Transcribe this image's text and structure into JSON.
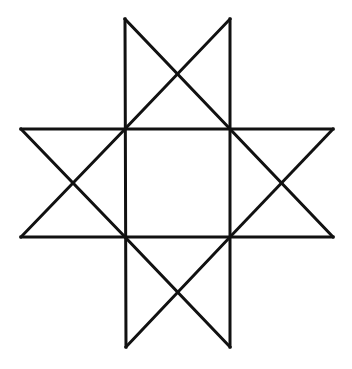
{
  "figure": {
    "background": "#ffffff",
    "stroke_color": "#111111",
    "stroke_width": 3,
    "vertices": {
      "top_left": [
        125,
        19
      ],
      "top_right": [
        230,
        19
      ],
      "left_top": [
        21,
        129
      ],
      "left_bottom": [
        21,
        237
      ],
      "right_top": [
        333,
        129
      ],
      "right_bottom": [
        333,
        237
      ],
      "bottom_left": [
        126,
        347
      ],
      "bottom_right": [
        230,
        347
      ],
      "inner_top_left": [
        125,
        129
      ],
      "inner_top_right": [
        230,
        129
      ],
      "inner_bottom_left": [
        125,
        237
      ],
      "inner_bottom_right": [
        230,
        237
      ]
    },
    "segments": [
      {
        "name": "horizontal-top-line",
        "from": [
          21,
          129
        ],
        "to": [
          333,
          129
        ]
      },
      {
        "name": "horizontal-bottom-line",
        "from": [
          21,
          237
        ],
        "to": [
          333,
          237
        ]
      },
      {
        "name": "vertical-left-line",
        "from": [
          125,
          19
        ],
        "to": [
          126,
          347
        ]
      },
      {
        "name": "vertical-right-line",
        "from": [
          230,
          19
        ],
        "to": [
          230,
          347
        ]
      },
      {
        "name": "top-diagonal-down",
        "from": [
          125,
          19
        ],
        "to": [
          230,
          129
        ]
      },
      {
        "name": "top-diagonal-up",
        "from": [
          230,
          19
        ],
        "to": [
          125,
          129
        ]
      },
      {
        "name": "bottom-diagonal-down",
        "from": [
          125,
          237
        ],
        "to": [
          230,
          347
        ]
      },
      {
        "name": "bottom-diagonal-up",
        "from": [
          230,
          237
        ],
        "to": [
          126,
          347
        ]
      },
      {
        "name": "left-diagonal-down",
        "from": [
          21,
          129
        ],
        "to": [
          125,
          237
        ]
      },
      {
        "name": "left-diagonal-up",
        "from": [
          21,
          237
        ],
        "to": [
          125,
          129
        ]
      },
      {
        "name": "right-diagonal-down",
        "from": [
          230,
          129
        ],
        "to": [
          333,
          237
        ]
      },
      {
        "name": "right-diagonal-up",
        "from": [
          230,
          237
        ],
        "to": [
          333,
          129
        ]
      }
    ]
  }
}
